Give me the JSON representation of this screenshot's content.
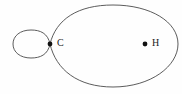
{
  "figure": {
    "width": 182,
    "height": 94,
    "background_color": "#fefefe",
    "stroke_color": "#4a4a4a",
    "stroke_width": 0.9,
    "marker_color": "#111111"
  },
  "points": [
    {
      "id": "C",
      "label": "C",
      "x": 50,
      "y": 44,
      "label_x": 57,
      "label_y": 38,
      "marker_radius": 2.4,
      "role": "node-cusp"
    },
    {
      "id": "H",
      "label": "H",
      "x": 145,
      "y": 44,
      "label_x": 152,
      "label_y": 38,
      "marker_radius": 2.4,
      "role": "interior-focus"
    }
  ],
  "curves": [
    {
      "id": "outer-loop",
      "name": "outer-loop-path",
      "description": "Large oval lobe from node C around to the right",
      "path": "M 50 44 C 56 19 78 5 113 5 C 151 5 178 22 178 44 C 178 66 151 87 113 87 C 78 87 56 70 50 44 Z"
    },
    {
      "id": "inner-loop",
      "name": "inner-loop-path",
      "description": "Small inner loop left of node C",
      "path": "M 50 44 C 48 33 40 30 31 30 C 20 30 13 36 13 44 C 13 52 20 58 31 58 C 40 58 48 55 50 44 Z"
    }
  ]
}
